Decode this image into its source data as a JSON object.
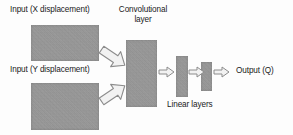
{
  "diagram": {
    "type": "neural-network-architecture",
    "background_color": "#fdfdfd",
    "block_color": "#9a9a9a",
    "text_color": "#1a1a1a",
    "arrow_fill": "#f2f2f2",
    "arrow_stroke": "#8c8c8c"
  },
  "labels": {
    "input_x": "Input (X displacement)",
    "input_y": "Input (Y displacement)",
    "convolutional_layer": "Convolutional layer",
    "linear_layers": "Linear layers",
    "output": "Output (Q)"
  },
  "blocks": [
    {
      "id": "input-x",
      "label": "Input (X displacement)",
      "x": 31,
      "y": 25,
      "width": 68,
      "height": 36
    },
    {
      "id": "input-y",
      "label": "Input (Y displacement)",
      "x": 31,
      "y": 83,
      "width": 68,
      "height": 47
    },
    {
      "id": "conv",
      "label": "Convolutional layer",
      "x": 126,
      "y": 40,
      "width": 31,
      "height": 67
    },
    {
      "id": "linear-1",
      "label": "Linear layer 1",
      "x": 176,
      "y": 56,
      "width": 12,
      "height": 41
    },
    {
      "id": "linear-2",
      "label": "Linear layer 2",
      "x": 201,
      "y": 62,
      "width": 11,
      "height": 29
    }
  ],
  "arrows": [
    {
      "id": "x-to-conv",
      "from": "input-x",
      "to": "conv",
      "direction": "down-right"
    },
    {
      "id": "y-to-conv",
      "from": "input-y",
      "to": "conv",
      "direction": "up-right"
    },
    {
      "id": "conv-to-l1",
      "from": "conv",
      "to": "linear-1",
      "direction": "right"
    },
    {
      "id": "l1-to-l2",
      "from": "linear-1",
      "to": "linear-2",
      "direction": "right"
    },
    {
      "id": "l2-to-output",
      "from": "linear-2",
      "to": "output",
      "direction": "right"
    }
  ]
}
